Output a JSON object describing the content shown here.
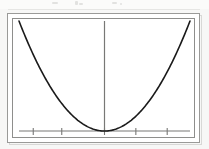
{
  "figure": {
    "title": "",
    "background_color": "#ffffff",
    "page_background_color": "#f7f7f6",
    "frame_color": "#9a9a98",
    "plot_border_color": "#8e8e8c",
    "axis_color": "#787876",
    "curve_color": "#1a1a1a",
    "artifact_color": "#e2e2e0"
  },
  "chart_data": {
    "type": "line",
    "title": "",
    "subtitle": "",
    "xlabel": "",
    "ylabel": "",
    "legend": [],
    "legend_position": "none",
    "grid": false,
    "xlim": [
      -3,
      3
    ],
    "ylim": [
      0,
      9
    ],
    "x_tick_labels": [
      "",
      "",
      "",
      "",
      ""
    ],
    "x_tick_values": [
      -2.5,
      -1.5,
      0,
      1.1,
      2.2
    ],
    "y_tick_labels": [],
    "y_tick_values": [],
    "axes": {
      "x_axis_visible": true,
      "y_axis_visible": true,
      "x_axis_y_value": 0,
      "y_axis_x_value": 0,
      "tick_direction": "down",
      "tick_count": 5
    },
    "series": [
      {
        "name": "parabola",
        "kind": "curve",
        "equation": "y = x^2",
        "color": "#1a1a1a",
        "line_width": 1.6,
        "vertex": [
          0,
          0
        ],
        "x": [
          -2.95,
          -2.6,
          -2.2,
          -1.8,
          -1.4,
          -1.0,
          -0.6,
          -0.3,
          0,
          0.3,
          0.6,
          1.0,
          1.4,
          1.8,
          2.2,
          2.6,
          3.05
        ],
        "values": [
          8.7,
          6.76,
          4.84,
          3.24,
          1.96,
          1.0,
          0.36,
          0.09,
          0,
          0.09,
          0.36,
          1.0,
          1.96,
          3.24,
          4.84,
          6.76,
          9.3
        ]
      }
    ],
    "annotations": []
  },
  "artifacts": {
    "top_smudges": [
      "smudge-1",
      "smudge-2",
      "smudge-3",
      "smudge-4",
      "smudge-5"
    ]
  }
}
